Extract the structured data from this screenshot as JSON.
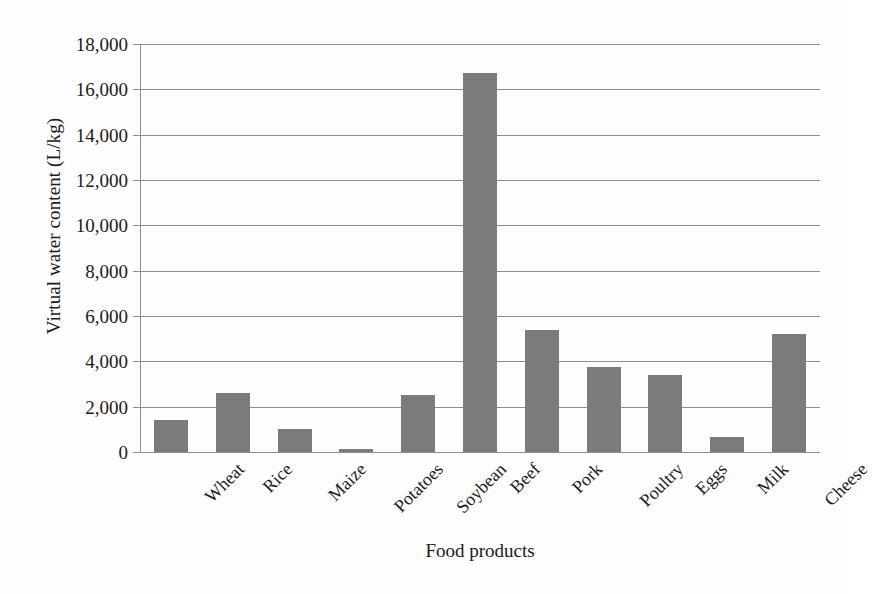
{
  "chart_data": {
    "type": "bar",
    "title": "",
    "xlabel": "Food products",
    "ylabel": "Virtual water content (L/kg)",
    "categories": [
      "Wheat",
      "Rice",
      "Maize",
      "Potatoes",
      "Soybean",
      "Beef",
      "Pork",
      "Poultry",
      "Eggs",
      "Milk",
      "Cheese"
    ],
    "values": [
      1400,
      2600,
      1000,
      130,
      2500,
      16700,
      5400,
      3750,
      3400,
      660,
      5200
    ],
    "ylim": [
      0,
      18000
    ],
    "yticks": [
      0,
      2000,
      4000,
      6000,
      8000,
      10000,
      12000,
      14000,
      16000,
      18000
    ],
    "ytick_labels": [
      "0",
      "2,000",
      "4,000",
      "6,000",
      "8,000",
      "10,000",
      "12,000",
      "14,000",
      "16,000",
      "18,000"
    ],
    "grid": true,
    "legend": false,
    "bar_color": "#7b7b7b",
    "gridline_color": "#8e8e8e",
    "background_color": "#fdfdfd",
    "xtick_label_rotation": -45
  }
}
